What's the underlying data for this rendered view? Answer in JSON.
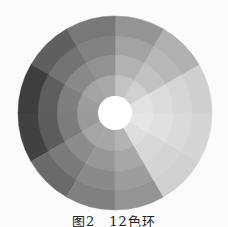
{
  "figure": {
    "caption": "图2　12色环",
    "center": [
      115,
      113
    ],
    "radii": [
      17,
      38,
      58,
      77,
      97
    ],
    "center_color": "#ffffff",
    "sector_count": 12,
    "start_angle_deg": 0,
    "sectors": [
      {
        "rings": [
          "#f2f2f2",
          "#e2e2e2",
          "#dcdcdc",
          "#d6d6d6",
          "#cfcfcf"
        ]
      },
      {
        "rings": [
          "#e4e4e4",
          "#d0d0d0",
          "#c2c2c2",
          "#b8b8b8",
          "#b0b0b0"
        ]
      },
      {
        "rings": [
          "#d8d8d8",
          "#c4c4c4",
          "#b2b2b2",
          "#a3a3a3",
          "#959595"
        ]
      },
      {
        "rings": [
          "#c8c8c8",
          "#a9a9a9",
          "#929292",
          "#828282",
          "#787878"
        ]
      },
      {
        "rings": [
          "#c4c4c4",
          "#a4a4a4",
          "#898989",
          "#737373",
          "#5f5f5f"
        ]
      },
      {
        "rings": [
          "#c2c2c2",
          "#9d9d9d",
          "#7f7f7f",
          "#5e5e5e",
          "#3e3e3e"
        ]
      },
      {
        "rings": [
          "#c0c0c0",
          "#9a9a9a",
          "#7c7c7c",
          "#5c5c5c",
          "#414141"
        ]
      },
      {
        "rings": [
          "#bdbdbd",
          "#a5a5a5",
          "#8c8c8c",
          "#7a7a7a",
          "#6a6a6a"
        ]
      },
      {
        "rings": [
          "#b9b9b9",
          "#a6a6a6",
          "#969696",
          "#8a8a8a",
          "#808080"
        ]
      },
      {
        "rings": [
          "#c6c6c6",
          "#b3b3b3",
          "#a7a7a7",
          "#9d9d9d",
          "#949494"
        ]
      },
      {
        "rings": [
          "#e6e6e6",
          "#dedede",
          "#d8d8d8",
          "#d4d4d4",
          "#d0d0d0"
        ]
      },
      {
        "rings": [
          "#f0f0f0",
          "#e6e6e6",
          "#e0e0e0",
          "#dadada",
          "#d5d5d5"
        ]
      }
    ]
  }
}
